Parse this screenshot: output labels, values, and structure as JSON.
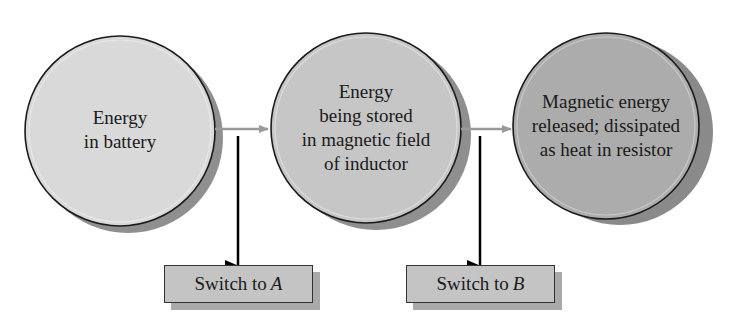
{
  "diagram": {
    "type": "flow",
    "nodes": [
      {
        "id": "battery",
        "lines": [
          "Energy",
          "in battery"
        ],
        "fill": "#d9d9d9"
      },
      {
        "id": "inductor",
        "lines": [
          "Energy",
          "being stored",
          "in magnetic field",
          "of inductor"
        ],
        "fill": "#c6c6c6"
      },
      {
        "id": "resistor",
        "lines": [
          "Magnetic energy",
          "released; dissipated",
          "as heat in resistor"
        ],
        "fill": "#acacac"
      }
    ],
    "edges": [
      {
        "from": "battery",
        "to": "inductor",
        "trigger": "switch_a"
      },
      {
        "from": "inductor",
        "to": "resistor",
        "trigger": "switch_b"
      }
    ],
    "switches": {
      "switch_a": {
        "prefix": "Switch to",
        "var": "A"
      },
      "switch_b": {
        "prefix": "Switch to",
        "var": "B"
      }
    },
    "colors": {
      "outline": "#1a1a1a",
      "shadow": "#8f8f8f",
      "arrow": "#9a9a9a",
      "switch_fill": "#c4c4c4",
      "switch_arrow": "#000000"
    }
  }
}
